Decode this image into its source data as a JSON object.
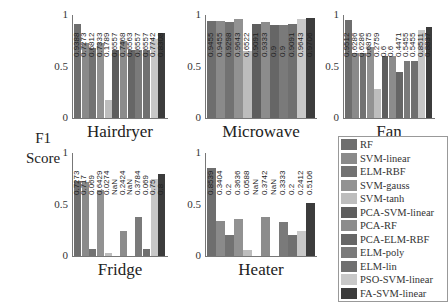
{
  "ylabel": [
    "F1",
    "Score"
  ],
  "methods": [
    "RF",
    "SVM-linear",
    "ELM-RBF",
    "SVM-gauss",
    "SVM-tanh",
    "PCA-SVM-linear",
    "PCA-RF",
    "PCA-ELM-RBF",
    "ELM-poly",
    "ELM-lin",
    "PSO-SVM-linear",
    "FA-SVM-linear"
  ],
  "colors": [
    "#6e6e6e",
    "#8a8a8a",
    "#727272",
    "#929292",
    "#bdbdbd",
    "#5e5e5e",
    "#8c8c8c",
    "#666666",
    "#7a7a7a",
    "#707070",
    "#c8c8c8",
    "#3c3c3c"
  ],
  "yticks": [
    "0",
    "0.5",
    "1"
  ],
  "chart_data": [
    {
      "type": "bar",
      "title": "Hairdryer",
      "ylim": [
        0,
        1
      ],
      "categories": [
        "RF",
        "SVM-linear",
        "ELM-RBF",
        "SVM-gauss",
        "SVM-tanh",
        "PCA-SVM-linear",
        "PCA-RF",
        "PCA-ELM-RBF",
        "ELM-poly",
        "ELM-lin",
        "PSO-SVM-linear",
        "FA-SVM-linear"
      ],
      "values": [
        0.91,
        0.73,
        0.68,
        0.73,
        0.1789,
        0.66,
        0.75,
        0.66,
        0.66,
        0.66,
        0.77,
        0.83
      ],
      "labels": [
        "0.9388",
        "0.7273",
        "0.6812",
        "0.7333",
        "0.1789",
        "0.6557",
        "0.7468",
        "0.6563",
        "0.6557",
        "0.6557",
        "0.7742",
        "0.8308"
      ]
    },
    {
      "type": "bar",
      "title": "Microwave",
      "ylim": [
        0,
        1
      ],
      "categories": [
        "RF",
        "SVM-linear",
        "ELM-RBF",
        "SVM-gauss",
        "SVM-tanh",
        "PCA-SVM-linear",
        "PCA-RF",
        "PCA-ELM-RBF",
        "ELM-poly",
        "ELM-lin",
        "PSO-SVM-linear",
        "FA-SVM-linear"
      ],
      "values": [
        0.94,
        0.94,
        0.93,
        0.96,
        0.65,
        0.91,
        0.93,
        0.9,
        0.9,
        0.91,
        0.96,
        0.97
      ],
      "labels": [
        "0.9455",
        "0.9455",
        "0.9298",
        "0.9643",
        "0.6522",
        "0.9091",
        "0.9333",
        "0.9",
        "0.9",
        "0.9091",
        "0.9643",
        "0.9706"
      ]
    },
    {
      "type": "bar",
      "title": "Fan",
      "ylim": [
        0,
        1
      ],
      "categories": [
        "RF",
        "SVM-linear",
        "ELM-RBF",
        "SVM-gauss",
        "SVM-tanh",
        "PCA-SVM-linear",
        "PCA-RF",
        "PCA-ELM-RBF",
        "ELM-poly",
        "ELM-lin",
        "PSO-SVM-linear",
        "FA-SVM-linear"
      ],
      "values": [
        0.95,
        0.63,
        0.63,
        0.69,
        0.28,
        0.6,
        0.6,
        0.45,
        0.55,
        0.55,
        0.85,
        0.88
      ],
      "labels": [
        "0.9512",
        "0.6286",
        "0.6286",
        "0.6875",
        "0.2759",
        "0.6",
        "0.6",
        "0.4471",
        "0.5455",
        "0.5455",
        "0.8511",
        "0.8837"
      ]
    },
    {
      "type": "bar",
      "title": "Fridge",
      "ylim": [
        0,
        1
      ],
      "categories": [
        "RF",
        "SVM-linear",
        "ELM-RBF",
        "SVM-gauss",
        "SVM-tanh",
        "PCA-SVM-linear",
        "PCA-RF",
        "PCA-ELM-RBF",
        "ELM-poly",
        "ELM-lin",
        "PSO-SVM-linear",
        "FA-SVM-linear"
      ],
      "values": [
        0.7273,
        0.717,
        0.069,
        0.6429,
        0.0274,
        0,
        0.2424,
        0,
        0.3784,
        0.069,
        0.75,
        0.8
      ],
      "labels": [
        "0.7273",
        "0.717",
        "0.069",
        "0.6429",
        "0.0274",
        "NaN",
        "0.2424",
        "NaN",
        "0.3784",
        "0.069",
        "0.75",
        "0.8"
      ]
    },
    {
      "type": "bar",
      "title": "Heater",
      "ylim": [
        0,
        1
      ],
      "categories": [
        "RF",
        "SVM-linear",
        "ELM-RBF",
        "SVM-gauss",
        "SVM-tanh",
        "PCA-SVM-linear",
        "PCA-RF",
        "PCA-ELM-RBF",
        "ELM-poly",
        "ELM-lin",
        "PSO-SVM-linear",
        "FA-SVM-linear"
      ],
      "values": [
        0.8539,
        0.3404,
        0.2,
        0.3636,
        0.0588,
        0,
        0.3742,
        0,
        0.3333,
        0.2,
        0.2412,
        0.5106
      ],
      "labels": [
        "0.8539",
        "0.3404",
        "0.2",
        "0.3636",
        "0.0588",
        "NaN",
        "0.3742",
        "NaN",
        "0.3333",
        "0.2",
        "0.2412",
        "0.5106"
      ]
    }
  ]
}
